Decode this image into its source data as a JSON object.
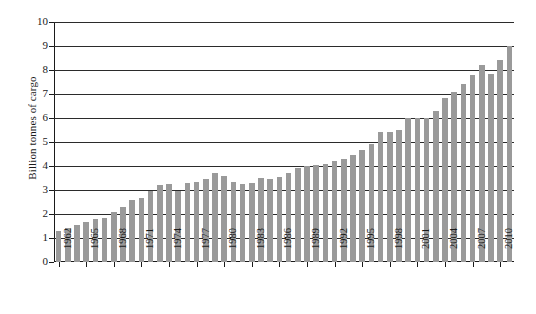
{
  "chart_data": {
    "type": "bar",
    "title": "",
    "subtitle": "",
    "xlabel": "",
    "ylabel": "Billion tonnes of cargo",
    "ylim": [
      0,
      10
    ],
    "ytick_step": 1,
    "yticks": [
      "0",
      "1",
      "2",
      "3",
      "4",
      "5",
      "6",
      "7",
      "8",
      "9",
      "10"
    ],
    "grid": true,
    "grid_axis": "y",
    "legend": false,
    "legend_position": "none",
    "bar_color": "#9a9a9a",
    "axis_color": "#1a1a1a",
    "grid_color": "#2b2b2b",
    "background": "#ffffff",
    "xtick_labels": [
      "1962",
      "1965",
      "1968",
      "1971",
      "1974",
      "1977",
      "1980",
      "1983",
      "1986",
      "1989",
      "1992",
      "1995",
      "1998",
      "2001",
      "2004",
      "2007",
      "2010"
    ],
    "xtick_label_rotation": 90,
    "xtick_every_n_categories": 3,
    "categories": [
      "1962",
      "1963",
      "1964",
      "1965",
      "1966",
      "1967",
      "1968",
      "1969",
      "1970",
      "1971",
      "1972",
      "1973",
      "1974",
      "1975",
      "1976",
      "1977",
      "1978",
      "1979",
      "1980",
      "1981",
      "1982",
      "1983",
      "1984",
      "1985",
      "1986",
      "1987",
      "1988",
      "1989",
      "1990",
      "1991",
      "1992",
      "1993",
      "1994",
      "1995",
      "1996",
      "1997",
      "1998",
      "1999",
      "2000",
      "2001",
      "2002",
      "2003",
      "2004",
      "2005",
      "2006",
      "2007",
      "2008",
      "2009",
      "2010",
      "2011"
    ],
    "values": [
      1.3,
      1.4,
      1.55,
      1.65,
      1.8,
      1.85,
      2.1,
      2.3,
      2.6,
      2.65,
      2.95,
      3.2,
      3.25,
      2.95,
      3.3,
      3.35,
      3.45,
      3.7,
      3.6,
      3.35,
      3.25,
      3.3,
      3.5,
      3.45,
      3.55,
      3.7,
      3.9,
      4.0,
      4.05,
      4.1,
      4.2,
      4.3,
      4.45,
      4.65,
      4.9,
      5.4,
      5.4,
      5.5,
      6.0,
      6.0,
      6.0,
      6.3,
      6.85,
      7.1,
      7.4,
      7.8,
      8.2,
      7.85,
      8.4,
      9.0
    ]
  }
}
